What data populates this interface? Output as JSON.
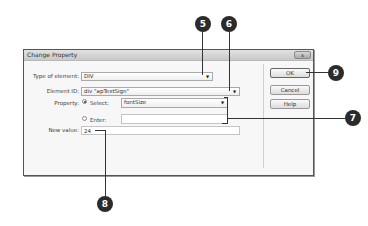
{
  "dialog": {
    "title": "Change Property",
    "close_icon_label": "x",
    "fields": {
      "type_of_element": {
        "label": "Type of element:",
        "value": "DIV"
      },
      "element_id": {
        "label": "Element ID:",
        "value": "div \"apTextSign\""
      },
      "property": {
        "label": "Property:",
        "select_option": {
          "label": "Select:",
          "selected": true,
          "value": "fontSize"
        },
        "enter_option": {
          "label": "Enter:",
          "selected": false,
          "value": ""
        }
      },
      "new_value": {
        "label": "New value:",
        "value": "24"
      }
    },
    "buttons": {
      "ok": "OK",
      "cancel": "Cancel",
      "help": "Help"
    }
  },
  "callouts": [
    {
      "number": "5",
      "target": "type-of-element-dropdown"
    },
    {
      "number": "6",
      "target": "element-id-dropdown"
    },
    {
      "number": "7",
      "target": "property-options"
    },
    {
      "number": "8",
      "target": "new-value-input"
    },
    {
      "number": "9",
      "target": "ok-button"
    }
  ],
  "colors": {
    "callout_bg": "#2b2b2b",
    "dialog_bg": "#f7f7f7",
    "titlebar": "#d0d0d0"
  }
}
